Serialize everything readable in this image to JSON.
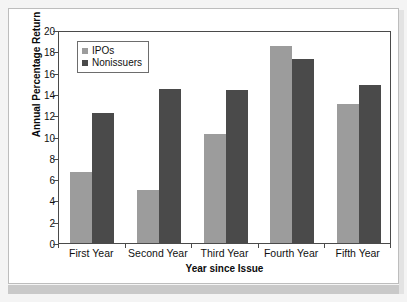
{
  "chart_data": {
    "type": "bar",
    "title": "",
    "xlabel": "Year since Issue",
    "ylabel": "Annual Percentage Return",
    "categories": [
      "First Year",
      "Second Year",
      "Third Year",
      "Fourth Year",
      "Fifth Year"
    ],
    "series": [
      {
        "name": "IPOs",
        "color": "#9c9c9c",
        "values": [
          6.7,
          5.0,
          10.2,
          18.5,
          13.1
        ]
      },
      {
        "name": "Nonissuers",
        "color": "#4a4a4a",
        "values": [
          12.2,
          14.5,
          14.4,
          17.3,
          14.8
        ]
      }
    ],
    "ylim": [
      0,
      20
    ],
    "ytick_labels": [
      "0",
      "2",
      "4",
      "6",
      "8",
      "10",
      "12",
      "14",
      "16",
      "18",
      "20"
    ],
    "ytick_values": [
      0,
      2,
      4,
      6,
      8,
      10,
      12,
      14,
      16,
      18,
      20
    ],
    "grid": false,
    "legend_position": "top-left",
    "legend_entries": [
      "IPOs",
      "Nonissuers"
    ]
  },
  "figure": {
    "background_color": "#ffffff",
    "frame_color": "#4a4a4a",
    "page_background": "#f4f4f4"
  }
}
